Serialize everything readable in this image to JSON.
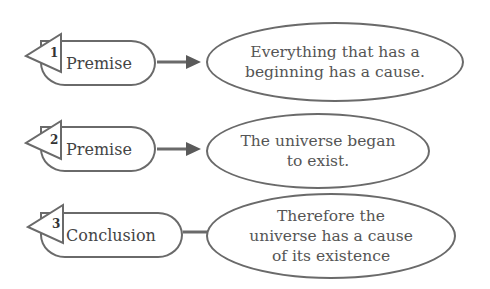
{
  "diagram": {
    "rows": [
      {
        "number": "1",
        "label": "Premise",
        "connector": "arrow",
        "statement_lines": [
          "Everything that has a",
          "beginning has a cause."
        ]
      },
      {
        "number": "2",
        "label": "Premise",
        "connector": "arrow",
        "statement_lines": [
          "The universe began",
          "to exist."
        ]
      },
      {
        "number": "3",
        "label": "Conclusion",
        "connector": "line",
        "statement_lines": [
          "Therefore the",
          "universe has a cause",
          "of its existence"
        ]
      }
    ],
    "colors": {
      "stroke": "#6a6a6a",
      "text": "#4a4a4a",
      "background": "#ffffff"
    }
  }
}
